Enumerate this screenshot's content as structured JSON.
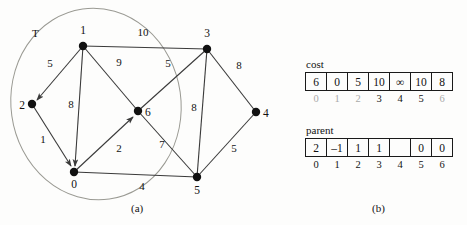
{
  "figure": {
    "caption_a": "(a)",
    "caption_b": "(b)"
  },
  "graph": {
    "set_label": "T",
    "nodes": [
      {
        "id": "0",
        "label": "0",
        "x": 74,
        "y": 172,
        "label_dx": 0,
        "label_dy": 14
      },
      {
        "id": "1",
        "label": "1",
        "x": 83,
        "y": 46,
        "label_dx": 0,
        "label_dy": -10
      },
      {
        "id": "2",
        "label": "2",
        "x": 32,
        "y": 104,
        "label_dx": -11,
        "label_dy": 4
      },
      {
        "id": "3",
        "label": "3",
        "x": 207,
        "y": 49,
        "label_dx": 0,
        "label_dy": -10
      },
      {
        "id": "4",
        "label": "4",
        "x": 256,
        "y": 112,
        "label_dx": 11,
        "label_dy": 4
      },
      {
        "id": "5",
        "label": "5",
        "x": 197,
        "y": 177,
        "label_dx": 0,
        "label_dy": 15
      },
      {
        "id": "6",
        "label": "6",
        "x": 138,
        "y": 111,
        "label_dx": 11,
        "label_dy": 4
      }
    ],
    "edges": [
      {
        "from": "1",
        "to": "3",
        "weight": "10",
        "lx": 143,
        "ly": 36,
        "arrow": false
      },
      {
        "from": "1",
        "to": "2",
        "weight": "5",
        "lx": 50,
        "ly": 67,
        "arrow": true
      },
      {
        "from": "1",
        "to": "6",
        "weight": "9",
        "lx": 119,
        "ly": 66,
        "arrow": false
      },
      {
        "from": "1",
        "to": "0",
        "weight": "8",
        "lx": 71,
        "ly": 108,
        "arrow": true
      },
      {
        "from": "2",
        "to": "0",
        "weight": "1",
        "lx": 43,
        "ly": 143,
        "arrow": true
      },
      {
        "from": "0",
        "to": "6",
        "weight": "2",
        "lx": 119,
        "ly": 152,
        "arrow": true
      },
      {
        "from": "0",
        "to": "5",
        "weight": "4",
        "lx": 142,
        "ly": 190,
        "arrow": false
      },
      {
        "from": "3",
        "to": "6",
        "weight": "5",
        "lx": 168,
        "ly": 67,
        "arrow": false
      },
      {
        "from": "3",
        "to": "4",
        "weight": "8",
        "lx": 239,
        "ly": 69,
        "arrow": false
      },
      {
        "from": "3",
        "to": "5",
        "weight": "8",
        "lx": 194,
        "ly": 111,
        "arrow": false
      },
      {
        "from": "6",
        "to": "5",
        "weight": "7",
        "lx": 162,
        "ly": 148,
        "arrow": false
      },
      {
        "from": "4",
        "to": "5",
        "weight": "5",
        "lx": 234,
        "ly": 152,
        "arrow": false
      }
    ]
  },
  "tables": {
    "cost": {
      "title": "cost",
      "values": [
        "6",
        "0",
        "5",
        "10",
        "∞",
        "10",
        "8"
      ],
      "indices": [
        "0",
        "1",
        "2",
        "3",
        "4",
        "5",
        "6"
      ],
      "index_dim": [
        true,
        true,
        true,
        false,
        false,
        false,
        true
      ]
    },
    "parent": {
      "title": "parent",
      "values": [
        "2",
        "–1",
        "1",
        "1",
        "",
        "0",
        "0"
      ],
      "indices": [
        "0",
        "1",
        "2",
        "3",
        "4",
        "5",
        "6"
      ],
      "index_dim": [
        false,
        false,
        false,
        false,
        false,
        false,
        false
      ]
    }
  }
}
